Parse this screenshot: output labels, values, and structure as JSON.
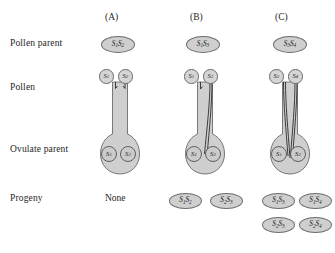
{
  "figure": {
    "row_labels": [
      {
        "id": "pollen-parent",
        "text": "Pollen parent"
      },
      {
        "id": "pollen",
        "text": "Pollen"
      },
      {
        "id": "ovulate-parent",
        "text": "Ovulate parent"
      },
      {
        "id": "progeny",
        "text": "Progeny"
      }
    ],
    "panels": [
      {
        "id": "a",
        "caption": "(A)",
        "pollen_parent": "S₁S₂",
        "pollen_grains": [
          "S₁",
          "S₂"
        ],
        "ovules": [
          "S₁",
          "S₂"
        ],
        "tube_growth": [
          "arrested",
          "arrested"
        ],
        "progeny_none_label": "None",
        "progeny": []
      },
      {
        "id": "b",
        "caption": "(B)",
        "pollen_parent": "S₁S₃",
        "pollen_grains": [
          "S₁",
          "S₃"
        ],
        "ovules": [
          "S₁",
          "S₂"
        ],
        "tube_growth": [
          "arrested",
          "full"
        ],
        "progeny": [
          "S₁S₂",
          "S₂S₃"
        ]
      },
      {
        "id": "c",
        "caption": "(C)",
        "pollen_parent": "S₃S₄",
        "pollen_grains": [
          "S₃",
          "S₄"
        ],
        "ovules": [
          "S₁",
          "S₂"
        ],
        "tube_growth": [
          "full",
          "full"
        ],
        "progeny": [
          "S₁S₃",
          "S₁S₄",
          "S₂S₃",
          "S₂S₄"
        ]
      }
    ],
    "colors": {
      "tissue_fill": "#cfcfcf",
      "tissue_stroke": "#6b6b6b",
      "background": "#ffffff",
      "text": "#262626"
    }
  }
}
